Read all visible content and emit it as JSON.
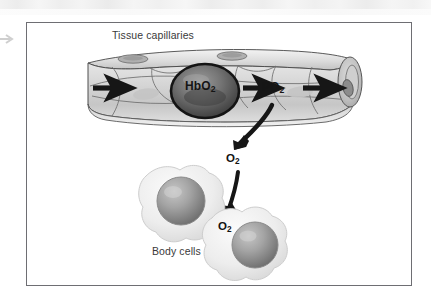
{
  "figure": {
    "domain_kind": "biology-illustration",
    "title_visible": false,
    "background_color": "#ffffff",
    "frame": {
      "border_color": "#6e6e73",
      "fill_color": "#ffffff",
      "x": 26,
      "y": 22,
      "width": 386,
      "height": 264
    },
    "artifacts": {
      "top_scan_band_label": "scan-band",
      "left_edge_arrow_label": "edge-mark"
    }
  },
  "labels": {
    "tissue_capillaries": "Tissue capillaries",
    "body_cells": "Body cells",
    "hbo2_main": "HbO",
    "hbo2_sub": "2",
    "po2_main": "PO",
    "po2_sub": "2",
    "o2_upper_main": "O",
    "o2_upper_sub": "2",
    "o2_lower_main": "O",
    "o2_lower_sub": "2"
  },
  "structures": {
    "capillary": {
      "name": "tissue-capillary-tube",
      "description": "cut-away cylindrical capillary with endothelial cells and nuclei",
      "fill_light": "#e3e3e3",
      "fill_mid": "#c9c9c9",
      "outline": "#4a4a4a"
    },
    "red_blood_cell": {
      "name": "red-blood-cell-hbo2",
      "description": "dark shaded erythrocyte carrying oxyhemoglobin",
      "fill": "#6a6a6a",
      "outline": "#1e1e1e"
    },
    "body_cell_left": {
      "name": "body-cell-left",
      "description": "amoeboid body cell with spherical nucleus",
      "cytoplasm": "#ececec",
      "nucleus": "#9a9a9a"
    },
    "body_cell_right": {
      "name": "body-cell-right",
      "description": "amoeboid body cell with spherical nucleus receiving oxygen",
      "cytoplasm": "#ececec",
      "nucleus": "#9a9a9a"
    }
  },
  "arrows": {
    "blood_flow_left": "straight black arrow pointing right into capillary",
    "blood_flow_middle": "straight black arrow pointing right from HbO2 to PO2",
    "blood_flow_right": "straight black arrow pointing right out of capillary",
    "diffusion_out_of_capillary": "curved black arrow from capillary down-left to O2",
    "diffusion_into_cell": "curved black arrow from O2 down into body cell"
  },
  "colors": {
    "ink": "#2b2b2b",
    "arrow_black": "#1a1a1a",
    "frame": "#6e6e73"
  }
}
